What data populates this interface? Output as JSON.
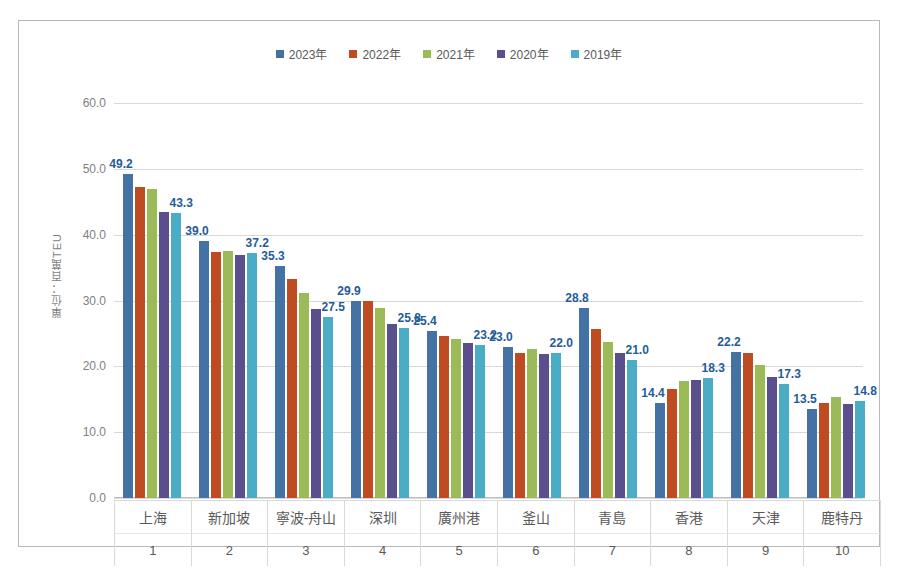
{
  "chart_data": {
    "type": "bar",
    "title": "",
    "subtitle": "",
    "xlabel": "",
    "ylabel": "單位：百萬TEU",
    "ylim": [
      0,
      60
    ],
    "ytick_step": 10,
    "ytick_labels": [
      "60.0",
      "50.0",
      "40.0",
      "30.0",
      "20.0",
      "10.0",
      "0.0"
    ],
    "grid": true,
    "legend_position": "top-center",
    "categories": [
      "上海",
      "新加坡",
      "寧波-舟山",
      "深圳",
      "廣州港",
      "釜山",
      "青島",
      "香港",
      "天津",
      "鹿特丹"
    ],
    "ranks": [
      "1",
      "2",
      "3",
      "4",
      "5",
      "6",
      "7",
      "8",
      "9",
      "10"
    ],
    "series": [
      {
        "name": "2023年",
        "color": "#4472A4",
        "values": [
          49.2,
          39.0,
          35.3,
          29.9,
          25.4,
          23.0,
          28.8,
          14.4,
          22.2,
          13.5
        ],
        "labeled": true,
        "labels": [
          "49.2",
          "39.0",
          "35.3",
          "29.9",
          "25.4",
          "23.0",
          "28.8",
          "14.4",
          "22.2",
          "13.5"
        ]
      },
      {
        "name": "2022年",
        "color": "#BE4B21",
        "values": [
          47.3,
          37.3,
          33.3,
          30.0,
          24.6,
          22.0,
          25.7,
          16.6,
          22.0,
          14.5
        ],
        "labeled": false,
        "labels": [
          "",
          "",
          "",
          "",
          "",
          "",
          "",
          "",
          "",
          ""
        ]
      },
      {
        "name": "2021年",
        "color": "#9BBB59",
        "values": [
          47.0,
          37.5,
          31.1,
          28.8,
          24.2,
          22.7,
          23.7,
          17.8,
          20.2,
          15.3
        ],
        "labeled": false,
        "labels": [
          "",
          "",
          "",
          "",
          "",
          "",
          "",
          "",
          "",
          ""
        ]
      },
      {
        "name": "2020年",
        "color": "#5B4E8C",
        "values": [
          43.5,
          36.9,
          28.7,
          26.5,
          23.5,
          21.8,
          22.0,
          17.9,
          18.4,
          14.3
        ],
        "labeled": false,
        "labels": [
          "",
          "",
          "",
          "",
          "",
          "",
          "",
          "",
          "",
          ""
        ]
      },
      {
        "name": "2019年",
        "color": "#4BACC6",
        "values": [
          43.3,
          37.2,
          27.5,
          25.8,
          23.2,
          22.0,
          21.0,
          18.3,
          17.3,
          14.8
        ],
        "labeled": true,
        "labels": [
          "43.3",
          "37.2",
          "27.5",
          "25.8",
          "23.2",
          "22.0",
          "21.0",
          "18.3",
          "17.3",
          "14.8"
        ]
      }
    ],
    "label_color": "#1F5C99"
  },
  "legend": {
    "items": [
      {
        "label": "2023年",
        "color": "#4472A4"
      },
      {
        "label": "2022年",
        "color": "#BE4B21"
      },
      {
        "label": "2021年",
        "color": "#9BBB59"
      },
      {
        "label": "2020年",
        "color": "#5B4E8C"
      },
      {
        "label": "2019年",
        "color": "#4BACC6"
      }
    ]
  },
  "axis": {
    "y_title": "單位：百萬TEU"
  },
  "colors": {
    "frame_border": "#B9B9B9",
    "gridline": "#D9D9D9",
    "tick_text": "#7F7F7F",
    "category_text": "#595959",
    "data_label": "#1F5C99"
  }
}
